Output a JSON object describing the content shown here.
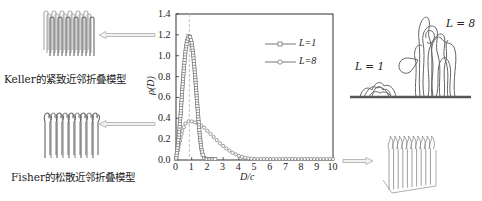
{
  "left_panel": {
    "top_model_caption": "Keller的紧致近邻折叠模型",
    "bottom_model_caption": "Fisher的松散近邻折叠模型",
    "top_model_icon": "dense-adjacent-fold-lamella-icon",
    "bottom_model_icon": "loose-adjacent-fold-lamella-icon"
  },
  "right_panel": {
    "label_L1": "L = 1",
    "label_L8": "L = 8",
    "bottom_icon": "loose-fold-crystal-block-icon"
  },
  "chart_data": {
    "type": "scatter",
    "title": "",
    "xlabel": "D/c",
    "ylabel": "ρ(D)",
    "xlim": [
      0,
      10
    ],
    "ylim": [
      0,
      1.4
    ],
    "x_ticks": [
      "0",
      "1",
      "2",
      "3",
      "4",
      "5",
      "6",
      "7",
      "8",
      "9",
      "10"
    ],
    "y_ticks": [
      "0.0",
      "0.2",
      "0.4",
      "0.6",
      "0.8",
      "1.0",
      "1.2",
      "1.4"
    ],
    "grid": false,
    "legend_position": "upper right",
    "reference_line": {
      "x": 0.85,
      "style": "dashed",
      "color": "#bbbbbb"
    },
    "series": [
      {
        "name": "L=1",
        "marker": "square",
        "x": [
          0.0,
          0.1,
          0.2,
          0.3,
          0.4,
          0.5,
          0.6,
          0.7,
          0.8,
          0.9,
          1.0,
          1.1,
          1.2,
          1.3,
          1.4,
          1.5,
          1.6,
          1.7,
          1.8,
          1.9,
          2.0,
          2.1,
          2.2,
          2.3,
          2.4,
          2.5
        ],
        "values": [
          0.0,
          0.12,
          0.27,
          0.45,
          0.68,
          0.88,
          1.04,
          1.14,
          1.19,
          1.18,
          1.12,
          1.0,
          0.84,
          0.64,
          0.44,
          0.26,
          0.12,
          0.05,
          0.02,
          0.01,
          0.0,
          0.0,
          0.0,
          0.0,
          0.0,
          0.0
        ]
      },
      {
        "name": "L=8",
        "marker": "circle",
        "x": [
          0.0,
          0.2,
          0.4,
          0.6,
          0.8,
          1.0,
          1.2,
          1.4,
          1.6,
          1.8,
          2.0,
          2.2,
          2.4,
          2.6,
          2.8,
          3.0,
          3.2,
          3.4,
          3.6,
          3.8,
          4.0,
          4.2,
          4.4,
          4.6,
          4.8,
          5.0,
          5.2,
          5.4,
          5.6,
          5.8,
          6.0,
          6.2,
          6.4,
          6.6,
          6.8,
          7.0,
          7.2,
          7.4,
          7.6,
          7.8,
          8.0,
          8.2,
          8.4,
          8.6,
          8.8,
          9.0,
          9.2,
          9.4,
          9.6,
          9.8,
          10.0
        ],
        "values": [
          0.0,
          0.15,
          0.28,
          0.35,
          0.37,
          0.37,
          0.36,
          0.35,
          0.33,
          0.31,
          0.28,
          0.25,
          0.22,
          0.19,
          0.16,
          0.135,
          0.11,
          0.09,
          0.07,
          0.055,
          0.04,
          0.03,
          0.022,
          0.016,
          0.012,
          0.009,
          0.007,
          0.005,
          0.004,
          0.003,
          0.002,
          0.002,
          0.001,
          0.001,
          0.001,
          0.0,
          0.0,
          0.0,
          0.0,
          0.0,
          0.0,
          0.0,
          0.0,
          0.0,
          0.0,
          0.0,
          0.0,
          0.0,
          0.0,
          0.0,
          0.0
        ]
      }
    ]
  }
}
